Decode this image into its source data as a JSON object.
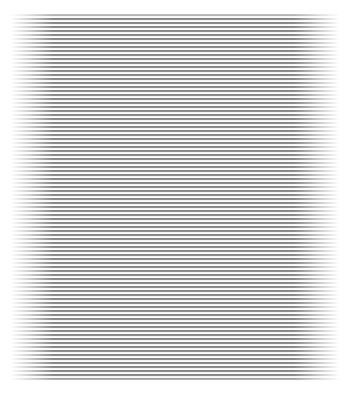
{
  "image": {
    "description": "horizontal gray stripe pattern fading at left and right edges",
    "stripe_period_px": 4,
    "stripe_color": "#8c8c8c",
    "gap_color": "#ffffff",
    "background": "#ffffff"
  }
}
